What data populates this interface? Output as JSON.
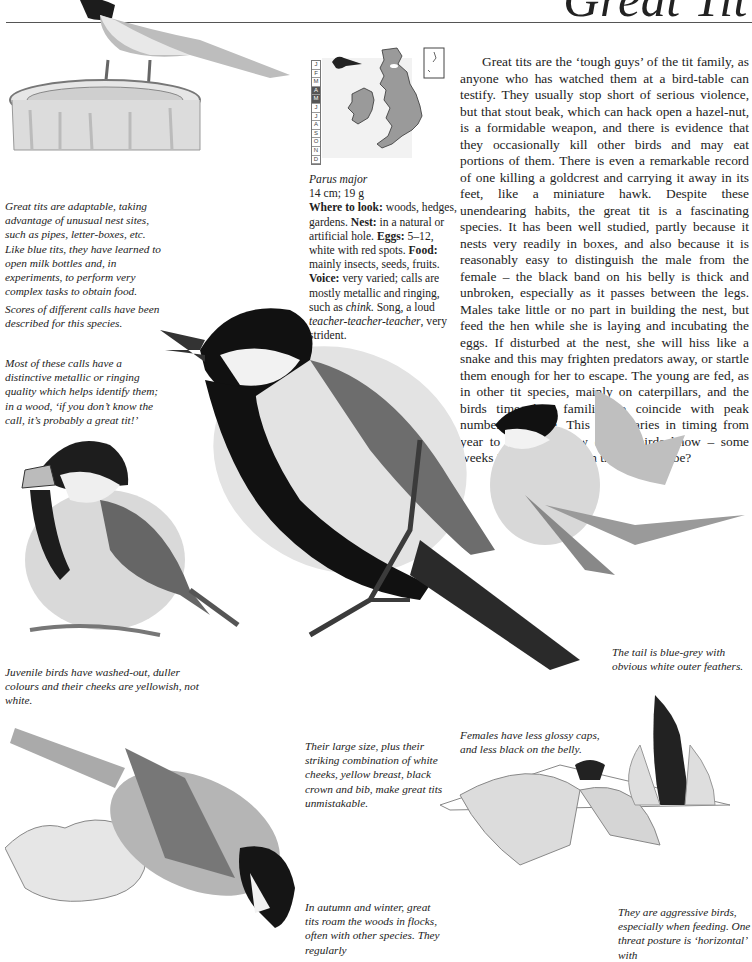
{
  "page": {
    "title": "Great Tit"
  },
  "species": {
    "latin_name": "Parus major",
    "size": "14 cm; 19 g",
    "where_label": "Where to look:",
    "where_text": " woods, hedges, gardens. ",
    "nest_label": "Nest:",
    "nest_text": " in a natural or artificial hole. ",
    "eggs_label": "Eggs:",
    "eggs_text": " 5–12, white with red spots. ",
    "food_label": "Food:",
    "food_text": " mainly insects, seeds, fruits. ",
    "voice_label": "Voice:",
    "voice_text": " very varied; calls are mostly metallic and ringing, such as ",
    "voice_call": "chink",
    "voice_song_intro": ". Song, a loud ",
    "voice_song": "teacher-teacher-teacher",
    "voice_end": ", very strident."
  },
  "calendar": {
    "months": [
      "J",
      "F",
      "M",
      "A",
      "M",
      "J",
      "J",
      "A",
      "S",
      "O",
      "N",
      "D"
    ],
    "active": [
      3,
      4
    ]
  },
  "map": {
    "icon": "bird-silhouette-icon",
    "region": "British Isles",
    "fill_color": "#9a9a9a"
  },
  "main_text": "Great tits are the ‘tough guys’ of the tit family, as anyone who has watched them at a bird-table can testify. They usually stop short of serious violence, but that stout beak, which can hack open a hazel-nut, is a formidable weapon, and there is evidence that they occasionally kill other birds and may eat portions of them. There is even a remarkable record of one killing a goldcrest and carrying it away in its feet, like a miniature hawk. Despite these unendearing habits, the great tit is a fascinating species. It has been well studied, partly because it nests very readily in boxes, and also because it is reasonably easy to distinguish the male from the female – the black band on his belly is thick and unbroken, especially as it passes between the legs. Males take little or no part in building the nest, but feed the hen while she is laying and incubating the eggs. If disturbed at the nest, she will hiss like a snake and this may frighten predators away, or startle them enough for her to escape. The young are fed, as in other tit species, mainly on caterpillars, and the birds time their families to coincide with peak numbers of these. This peak varies in timing from year to year. But how do the birds know – some weeks in advance – when the peak will be?",
  "captions": {
    "adaptable": "Great tits are adaptable, taking advantage of unusual nest sites, such as pipes, letter-boxes, etc. Like blue tits, they have learned to open milk bottles and, in experiments, to perform very complex tasks to obtain food.",
    "calls": "Scores of different calls have been described for this species.",
    "metallic": "Most of these calls have a distinctive metallic or ringing quality which helps identify them; in a wood, ‘if you don’t know the call, it’s probably a great tit!’",
    "juvenile": "Juvenile birds have washed-out, duller colours and their cheeks are yellowish, not white.",
    "tail": "The tail is blue-grey with obvious white outer feathers.",
    "size": "Their large size, plus their striking combination of white cheeks, yellow breast, black crown and bib, make great tits unmistakable.",
    "females": "Females have less glossy caps, and less black on the belly.",
    "autumn": "In autumn and winter, great tits roam the woods in flocks, often with other species. They regularly",
    "aggressive": "They are aggressive birds, especially when feeding. One threat posture is ‘horizontal’ with"
  }
}
